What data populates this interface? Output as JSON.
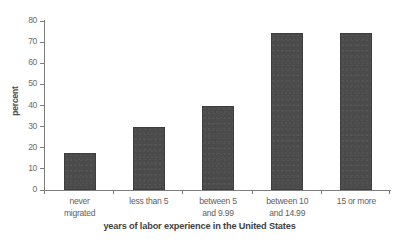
{
  "chart_data": {
    "type": "bar",
    "title": "",
    "xlabel": "years of labor experience in the United States",
    "ylabel": "percent",
    "categories": [
      "never\nmigrated",
      "less than 5",
      "between 5\nand 9.99",
      "between 10\nand 14.99",
      "15 or more"
    ],
    "category_lines": [
      [
        "never",
        "migrated"
      ],
      [
        "less than 5",
        ""
      ],
      [
        "between 5",
        "and 9.99"
      ],
      [
        "between 10",
        "and 14.99"
      ],
      [
        "15 or more",
        ""
      ]
    ],
    "values": [
      17.5,
      30,
      40,
      74.5,
      74.5
    ],
    "ylim": [
      0,
      80
    ],
    "ytick_values": [
      0,
      10,
      20,
      30,
      40,
      50,
      60,
      70,
      80
    ],
    "ytick_labels": [
      "0",
      "10",
      "20",
      "30",
      "40",
      "50",
      "60",
      "70",
      "80"
    ],
    "grid": false,
    "legend": null,
    "bar_color": "#4b4b4b",
    "axis_color": "#7d7d7d",
    "text_color": "#5f5f5f"
  }
}
